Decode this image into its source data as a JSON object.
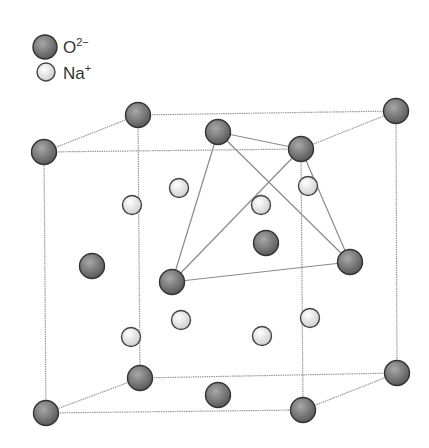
{
  "legend": {
    "items": [
      {
        "ion": "oxide",
        "base": "O",
        "charge": "2−",
        "x": 45,
        "y": 47
      },
      {
        "ion": "sodium",
        "base": "Na",
        "charge": "+",
        "x": 46,
        "y": 72
      }
    ]
  },
  "colors": {
    "oxide_fill_light": "#a8a8a8",
    "oxide_fill_dark": "#5a5a5a",
    "oxide_stroke": "#333333",
    "sodium_fill_light": "#ffffff",
    "sodium_fill_dark": "#cfcfcf",
    "sodium_stroke": "#444444",
    "cell_edge": "#9a9a9a",
    "tetra_edge": "#8a8a8a"
  },
  "cell_edges": [
    [
      138,
      115,
      396,
      111
    ],
    [
      44,
      152,
      301,
      149
    ],
    [
      138,
      115,
      44,
      152
    ],
    [
      396,
      111,
      301,
      149
    ],
    [
      140,
      378,
      397,
      373
    ],
    [
      46,
      413,
      303,
      410
    ],
    [
      140,
      378,
      46,
      413
    ],
    [
      397,
      373,
      303,
      410
    ],
    [
      44,
      152,
      46,
      413
    ],
    [
      301,
      149,
      303,
      410
    ],
    [
      138,
      115,
      140,
      378
    ],
    [
      396,
      111,
      397,
      373
    ]
  ],
  "tetrahedron_edges": [
    [
      218,
      132,
      301,
      149
    ],
    [
      218,
      132,
      172,
      282
    ],
    [
      218,
      132,
      350,
      262
    ],
    [
      301,
      149,
      172,
      282
    ],
    [
      301,
      149,
      350,
      262
    ],
    [
      172,
      282,
      350,
      262
    ]
  ],
  "oxide_ions": [
    {
      "x": 138,
      "y": 115
    },
    {
      "x": 396,
      "y": 111
    },
    {
      "x": 218,
      "y": 132
    },
    {
      "x": 44,
      "y": 152
    },
    {
      "x": 301,
      "y": 149
    },
    {
      "x": 266,
      "y": 243
    },
    {
      "x": 92,
      "y": 266
    },
    {
      "x": 350,
      "y": 262
    },
    {
      "x": 172,
      "y": 282
    },
    {
      "x": 140,
      "y": 378
    },
    {
      "x": 397,
      "y": 373
    },
    {
      "x": 218,
      "y": 395
    },
    {
      "x": 46,
      "y": 413
    },
    {
      "x": 303,
      "y": 410
    }
  ],
  "sodium_ions": [
    {
      "x": 179,
      "y": 188
    },
    {
      "x": 308,
      "y": 186
    },
    {
      "x": 132,
      "y": 205
    },
    {
      "x": 261,
      "y": 205
    },
    {
      "x": 181,
      "y": 320
    },
    {
      "x": 310,
      "y": 318
    },
    {
      "x": 131,
      "y": 337
    },
    {
      "x": 262,
      "y": 336
    }
  ]
}
